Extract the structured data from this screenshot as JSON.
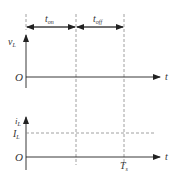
{
  "diagram": {
    "labels": {
      "t_on": "t",
      "t_on_sub": "on",
      "t_off": "t",
      "t_off_sub": "off",
      "vL": "v",
      "vL_sub": "L",
      "origin_top": "O",
      "t_top": "t",
      "iL": "i",
      "iL_sub": "L",
      "IL": "I",
      "IL_sub": "L",
      "origin_bottom": "O",
      "t_bottom": "t",
      "Ts": "T",
      "Ts_sub": "s"
    },
    "colors": {
      "line": "#222222",
      "dashed": "#888888"
    }
  }
}
